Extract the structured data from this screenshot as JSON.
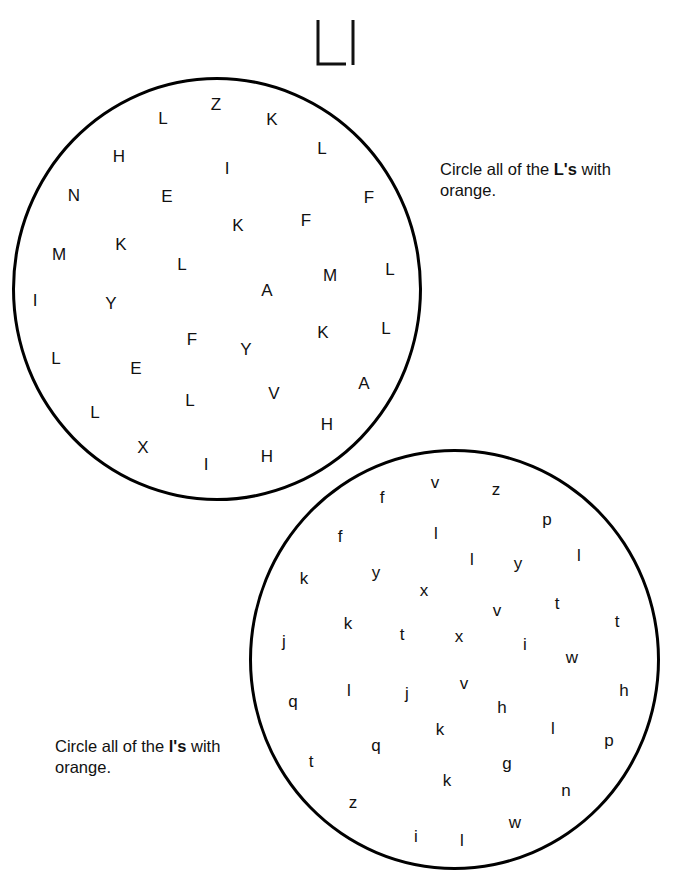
{
  "page": {
    "title_letters": "Ll",
    "instructions": [
      {
        "prefix": "Circle all of the ",
        "target": "L's",
        "suffix": " with",
        "line2": "orange."
      },
      {
        "prefix": "Circle all of the ",
        "target": "l's",
        "suffix": " with",
        "line2": "orange."
      }
    ],
    "uppercase_circle": {
      "letters": [
        {
          "ch": "L",
          "x": 163,
          "y": 118
        },
        {
          "ch": "Z",
          "x": 216,
          "y": 104
        },
        {
          "ch": "K",
          "x": 272,
          "y": 119
        },
        {
          "ch": "H",
          "x": 119,
          "y": 156
        },
        {
          "ch": "I",
          "x": 227,
          "y": 168
        },
        {
          "ch": "L",
          "x": 322,
          "y": 148
        },
        {
          "ch": "N",
          "x": 74,
          "y": 195
        },
        {
          "ch": "E",
          "x": 167,
          "y": 196
        },
        {
          "ch": "F",
          "x": 369,
          "y": 197
        },
        {
          "ch": "K",
          "x": 238,
          "y": 225
        },
        {
          "ch": "F",
          "x": 306,
          "y": 220
        },
        {
          "ch": "M",
          "x": 59,
          "y": 254
        },
        {
          "ch": "K",
          "x": 121,
          "y": 244
        },
        {
          "ch": "L",
          "x": 182,
          "y": 264
        },
        {
          "ch": "A",
          "x": 267,
          "y": 290
        },
        {
          "ch": "M",
          "x": 330,
          "y": 275
        },
        {
          "ch": "L",
          "x": 390,
          "y": 269
        },
        {
          "ch": "I",
          "x": 35,
          "y": 300
        },
        {
          "ch": "Y",
          "x": 111,
          "y": 303
        },
        {
          "ch": "F",
          "x": 192,
          "y": 339
        },
        {
          "ch": "Y",
          "x": 246,
          "y": 349
        },
        {
          "ch": "K",
          "x": 323,
          "y": 332
        },
        {
          "ch": "L",
          "x": 386,
          "y": 328
        },
        {
          "ch": "L",
          "x": 56,
          "y": 358
        },
        {
          "ch": "E",
          "x": 136,
          "y": 368
        },
        {
          "ch": "L",
          "x": 190,
          "y": 400
        },
        {
          "ch": "V",
          "x": 274,
          "y": 393
        },
        {
          "ch": "A",
          "x": 364,
          "y": 383
        },
        {
          "ch": "L",
          "x": 95,
          "y": 412
        },
        {
          "ch": "H",
          "x": 327,
          "y": 424
        },
        {
          "ch": "X",
          "x": 143,
          "y": 447
        },
        {
          "ch": "I",
          "x": 206,
          "y": 464
        },
        {
          "ch": "H",
          "x": 267,
          "y": 456
        }
      ]
    },
    "lowercase_circle": {
      "letters": [
        {
          "ch": "f",
          "x": 382,
          "y": 497
        },
        {
          "ch": "v",
          "x": 435,
          "y": 482
        },
        {
          "ch": "z",
          "x": 496,
          "y": 489
        },
        {
          "ch": "p",
          "x": 547,
          "y": 519
        },
        {
          "ch": "f",
          "x": 340,
          "y": 536
        },
        {
          "ch": "l",
          "x": 436,
          "y": 533
        },
        {
          "ch": "l",
          "x": 472,
          "y": 559
        },
        {
          "ch": "y",
          "x": 518,
          "y": 563
        },
        {
          "ch": "l",
          "x": 579,
          "y": 555
        },
        {
          "ch": "k",
          "x": 304,
          "y": 578
        },
        {
          "ch": "y",
          "x": 376,
          "y": 572
        },
        {
          "ch": "x",
          "x": 424,
          "y": 590
        },
        {
          "ch": "v",
          "x": 497,
          "y": 610
        },
        {
          "ch": "t",
          "x": 557,
          "y": 603
        },
        {
          "ch": "t",
          "x": 617,
          "y": 621
        },
        {
          "ch": "k",
          "x": 348,
          "y": 623
        },
        {
          "ch": "t",
          "x": 402,
          "y": 634
        },
        {
          "ch": "x",
          "x": 459,
          "y": 636
        },
        {
          "ch": "i",
          "x": 525,
          "y": 644
        },
        {
          "ch": "w",
          "x": 572,
          "y": 657
        },
        {
          "ch": "j",
          "x": 284,
          "y": 641
        },
        {
          "ch": "q",
          "x": 293,
          "y": 701
        },
        {
          "ch": "l",
          "x": 349,
          "y": 690
        },
        {
          "ch": "j",
          "x": 407,
          "y": 693
        },
        {
          "ch": "v",
          "x": 464,
          "y": 683
        },
        {
          "ch": "h",
          "x": 502,
          "y": 707
        },
        {
          "ch": "h",
          "x": 624,
          "y": 690
        },
        {
          "ch": "k",
          "x": 440,
          "y": 729
        },
        {
          "ch": "l",
          "x": 553,
          "y": 728
        },
        {
          "ch": "p",
          "x": 609,
          "y": 740
        },
        {
          "ch": "q",
          "x": 376,
          "y": 745
        },
        {
          "ch": "t",
          "x": 311,
          "y": 761
        },
        {
          "ch": "g",
          "x": 507,
          "y": 763
        },
        {
          "ch": "k",
          "x": 447,
          "y": 780
        },
        {
          "ch": "n",
          "x": 566,
          "y": 790
        },
        {
          "ch": "z",
          "x": 353,
          "y": 802
        },
        {
          "ch": "w",
          "x": 515,
          "y": 822
        },
        {
          "ch": "i",
          "x": 416,
          "y": 836
        },
        {
          "ch": "l",
          "x": 462,
          "y": 840
        }
      ]
    }
  }
}
